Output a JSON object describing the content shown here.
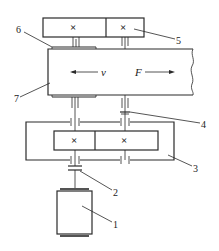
{
  "diagram": {
    "type": "mechanical transmission schematic",
    "labels": {
      "motor": "1",
      "coupling": "2",
      "housing": "3",
      "bearing": "4",
      "upper_gearbox": "5",
      "guide_plate": "6",
      "workpiece_bar": "7"
    },
    "annotations": {
      "velocity": "v",
      "force": "F"
    },
    "gear_marks": {
      "top_left": "×",
      "top_right": "×",
      "bottom_left": "×",
      "bottom_right": "×"
    },
    "colors": {
      "line": "#2a2a2a",
      "background": "#ffffff"
    }
  }
}
